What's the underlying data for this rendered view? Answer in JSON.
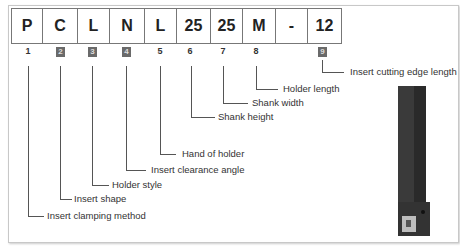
{
  "code": [
    "P",
    "C",
    "L",
    "N",
    "L",
    "25",
    "25",
    "M",
    "-",
    "12"
  ],
  "positions": [
    {
      "num": "1",
      "boxed": false,
      "label": "Insert clamping method"
    },
    {
      "num": "2",
      "boxed": true,
      "label": "Insert shape"
    },
    {
      "num": "3",
      "boxed": true,
      "label": "Holder style"
    },
    {
      "num": "4",
      "boxed": true,
      "label": "Insert clearance angle"
    },
    {
      "num": "5",
      "boxed": false,
      "label": "Hand of holder"
    },
    {
      "num": "6",
      "boxed": false,
      "label": "Shank height"
    },
    {
      "num": "7",
      "boxed": false,
      "label": "Shank width"
    },
    {
      "num": "8",
      "boxed": false,
      "label": "Holder length"
    },
    {
      "num": "9",
      "boxed": true,
      "label": "Insert cutting edge length"
    }
  ],
  "image": {
    "icon": "turning-tool-holder-icon"
  }
}
